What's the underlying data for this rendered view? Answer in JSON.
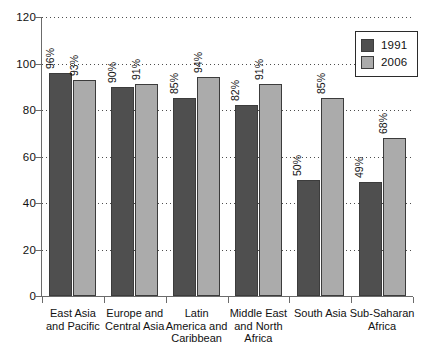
{
  "chart_data": {
    "type": "bar",
    "title": "",
    "subtitle": "",
    "xlabel": "",
    "ylabel": "",
    "ylim": [
      0,
      120
    ],
    "yticks": [
      0,
      20,
      40,
      60,
      80,
      100,
      120
    ],
    "ytick_labels": [
      "0",
      "20",
      "40",
      "60",
      "80",
      "100",
      "120"
    ],
    "grid": "horizontal-dotted",
    "legend_position": "top-right",
    "value_label_suffix": "%",
    "value_label_rotation": -90,
    "categories": [
      "East Asia and Pacific",
      "Europe and Central Asia",
      "Latin America and Caribbean",
      "Middle East and North Africa",
      "South Asia",
      "Sub-Saharan Africa"
    ],
    "category_label_lines": [
      [
        "East Asia",
        "and Pacific"
      ],
      [
        "Europe and",
        "Central Asia"
      ],
      [
        "Latin",
        "America and",
        "Caribbean"
      ],
      [
        "Middle East",
        "and North",
        "Africa"
      ],
      [
        "South Asia"
      ],
      [
        "Sub-Saharan",
        "Africa"
      ]
    ],
    "series": [
      {
        "name": "1991",
        "color": "#4f4f4f",
        "values": [
          96,
          90,
          85,
          82,
          50,
          49
        ],
        "value_labels": [
          "96%",
          "90%",
          "85%",
          "82%",
          "50%",
          "49%"
        ]
      },
      {
        "name": "2006",
        "color": "#ababab",
        "values": [
          93,
          91,
          94,
          91,
          85,
          68
        ],
        "value_labels": [
          "93%",
          "91%",
          "94%",
          "91%",
          "85%",
          "68%"
        ]
      }
    ]
  },
  "legend": {
    "items": [
      {
        "label": "1991",
        "color": "#4f4f4f"
      },
      {
        "label": "2006",
        "color": "#ababab"
      }
    ]
  },
  "colors": {
    "series_1991": "#4f4f4f",
    "series_2006": "#ababab",
    "axis": "#6b6b6b",
    "gridline": "#4d4d4d",
    "text": "#111111",
    "background": "#ffffff"
  }
}
